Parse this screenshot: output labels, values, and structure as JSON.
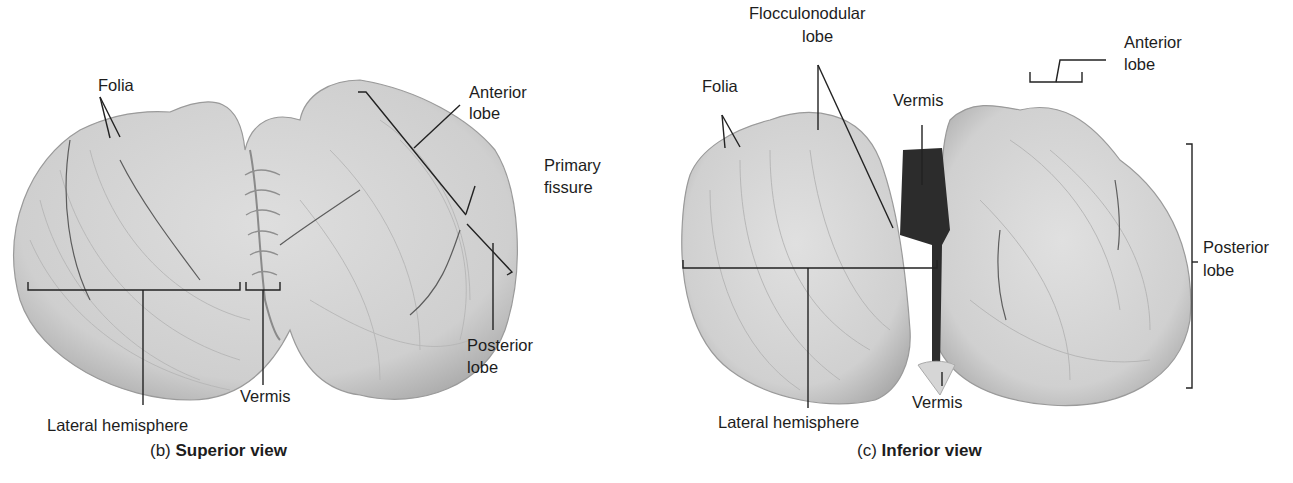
{
  "figure": {
    "panels": [
      {
        "id": "b",
        "caption_prefix": "(b)",
        "caption_title": "Superior view",
        "labels": {
          "folia": "Folia",
          "anterior_lobe_1": "Anterior",
          "anterior_lobe_2": "lobe",
          "primary_fissure_1": "Primary",
          "primary_fissure_2": "fissure",
          "posterior_lobe_1": "Posterior",
          "posterior_lobe_2": "lobe",
          "vermis": "Vermis",
          "lateral_hemisphere": "Lateral hemisphere"
        }
      },
      {
        "id": "c",
        "caption_prefix": "(c)",
        "caption_title": "Inferior view",
        "labels": {
          "flocculonodular_1": "Flocculonodular",
          "flocculonodular_2": "lobe",
          "folia": "Folia",
          "vermis_top": "Vermis",
          "anterior_lobe_1": "Anterior",
          "anterior_lobe_2": "lobe",
          "posterior_lobe_1": "Posterior",
          "posterior_lobe_2": "lobe",
          "vermis_bottom": "Vermis",
          "lateral_hemisphere": "Lateral hemisphere"
        }
      }
    ],
    "colors": {
      "tissue": "#d4d4d4",
      "tissue_shadow": "#a9a9a9",
      "fissure": "#555555",
      "leader": "#222222",
      "dark_gap": "#2a2a2a"
    }
  }
}
